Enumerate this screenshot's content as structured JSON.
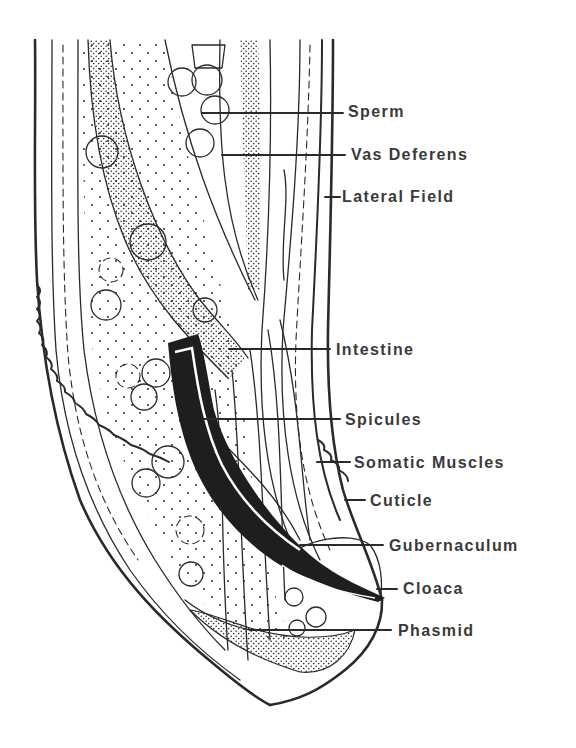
{
  "figure": {
    "ink_color": "#2a2a2a",
    "label_color": "#3a3a3a",
    "background": "#ffffff"
  },
  "labels": [
    {
      "id": "sperm",
      "text": "Sperm",
      "x": 348,
      "y": 104,
      "line": [
        202,
        113,
        343,
        113
      ]
    },
    {
      "id": "vas-deferens",
      "text": "Vas Deferens",
      "x": 351,
      "y": 148,
      "line": [
        222,
        155,
        345,
        155
      ]
    },
    {
      "id": "lateral-field",
      "text": "Lateral Field",
      "x": 342,
      "y": 189,
      "line": [
        325,
        197,
        340,
        197
      ]
    },
    {
      "id": "intestine",
      "text": "Intestine",
      "x": 336,
      "y": 342,
      "line": [
        229,
        349,
        330,
        349
      ]
    },
    {
      "id": "spicules",
      "text": "Spicules",
      "x": 345,
      "y": 413,
      "line": [
        204,
        419,
        340,
        419
      ]
    },
    {
      "id": "somatic-muscles",
      "text": "Somatic Muscles",
      "x": 354,
      "y": 455,
      "line": [
        317,
        462,
        350,
        462
      ]
    },
    {
      "id": "cuticle",
      "text": "Cuticle",
      "x": 370,
      "y": 494,
      "line": [
        345,
        500,
        365,
        500
      ]
    },
    {
      "id": "gubernaculum",
      "text": "Gubernaculum",
      "x": 389,
      "y": 538,
      "line": [
        300,
        545,
        383,
        545
      ]
    },
    {
      "id": "cloaca",
      "text": "Cloaca",
      "x": 403,
      "y": 582,
      "line": [
        377,
        589,
        397,
        589
      ]
    },
    {
      "id": "phasmid",
      "text": "Phasmid",
      "x": 398,
      "y": 624,
      "line": [
        250,
        630,
        391,
        630
      ]
    }
  ]
}
